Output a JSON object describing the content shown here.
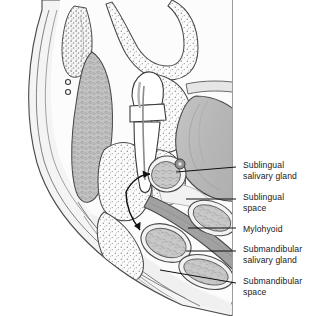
{
  "figure": {
    "kind": "anatomical-illustration",
    "view": "coronal cross-section through mandible and floor of mouth",
    "background_color": "#ffffff",
    "line_color": "#3a3a3a",
    "label_color": "#1a1a1a"
  },
  "labels": [
    {
      "id": "sublingual-salivary-gland",
      "line1": "Sublingual",
      "line2": "salivary gland",
      "x": 243,
      "y": 160,
      "leader": {
        "type": "straight",
        "x1": 236,
        "y1": 167,
        "x2": 176,
        "y2": 172
      }
    },
    {
      "id": "sublingual-space",
      "line1": "Sublingual",
      "line2": "space",
      "x": 243,
      "y": 192,
      "leader": {
        "type": "straight",
        "x1": 236,
        "y1": 199,
        "x2": 186,
        "y2": 199
      }
    },
    {
      "id": "mylohyoid",
      "line1": "Mylohyoid",
      "line2": "",
      "x": 243,
      "y": 224,
      "leader": {
        "type": "straight",
        "x1": 236,
        "y1": 228,
        "x2": 188,
        "y2": 228
      }
    },
    {
      "id": "submandibular-salivary-gland",
      "line1": "Submandibular",
      "line2": "salivary gland",
      "x": 243,
      "y": 244,
      "leader": {
        "type": "straight",
        "x1": 236,
        "y1": 251,
        "x2": 186,
        "y2": 251
      }
    },
    {
      "id": "submandibular-space",
      "line1": "Submandibular",
      "line2": "space",
      "x": 243,
      "y": 276,
      "leader": {
        "type": "straight",
        "x1": 236,
        "y1": 283,
        "x2": 160,
        "y2": 270
      }
    }
  ],
  "structures": [
    {
      "id": "skin-soft-tissue-envelope",
      "name": "skin and subcutaneous soft tissue",
      "fill": "#f4f4f4"
    },
    {
      "id": "mandible",
      "name": "mandible (alveolar bone, stippled)",
      "fill": "#fafafa"
    },
    {
      "id": "tooth",
      "name": "mandibular molar with root and pulp canal",
      "fill": "#ffffff"
    },
    {
      "id": "tongue",
      "name": "tongue",
      "fill": "#b9b9b9"
    },
    {
      "id": "buccinator",
      "name": "buccinator muscle",
      "fill": "#c3c3c3"
    },
    {
      "id": "mylohyoid-muscle",
      "name": "mylohyoid muscle band",
      "fill": "#a8a8a8"
    },
    {
      "id": "sublingual-gland-body",
      "name": "sublingual salivary gland",
      "fill": "#c9c9c9"
    },
    {
      "id": "submandibular-gland-body",
      "name": "submandibular salivary gland",
      "fill": "#c9c9c9"
    },
    {
      "id": "vessel-dots",
      "name": "vessels in cross-section",
      "fill": "#555555"
    }
  ],
  "arrows": [
    {
      "id": "spread-to-sublingual-space",
      "description": "infection spread from tooth apex superiorly into sublingual space"
    },
    {
      "id": "spread-to-submandibular-space",
      "description": "infection spread from tooth apex inferiorly into submandibular space"
    }
  ]
}
